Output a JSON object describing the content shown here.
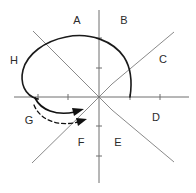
{
  "figure": {
    "background_color": "#ffffff",
    "width": 196,
    "height": 193
  },
  "colors": {
    "axis": "#6e6e6e",
    "diagonal": "#8a8a8a",
    "curve": "#1a1a1a",
    "arrow": "#111111",
    "label_text": "#2b2b2b"
  },
  "axes": {
    "origin": {
      "x": 99,
      "y": 97
    },
    "x_axis": {
      "x1": 14,
      "y1": 97,
      "x2": 189,
      "y2": 97
    },
    "y_axis": {
      "x1": 99,
      "y1": 10,
      "x2": 99,
      "y2": 183
    },
    "x_ticks": [
      38,
      68,
      130,
      160
    ],
    "y_ticks": [
      38,
      68,
      126,
      156
    ],
    "tick_length": 6
  },
  "diagonals": [
    {
      "name": "diagonal-up-right",
      "x1": 112,
      "y1": 84,
      "x2": 174,
      "y2": 32
    },
    {
      "name": "diagonal-down-right",
      "x1": 112,
      "y1": 110,
      "x2": 174,
      "y2": 162
    },
    {
      "name": "diagonal-down-left",
      "x1": 86,
      "y1": 110,
      "x2": 32,
      "y2": 163
    },
    {
      "name": "diagonal-up-left",
      "x1": 86,
      "y1": 84,
      "x2": 33,
      "y2": 31
    }
  ],
  "region_labels": [
    {
      "id": "A",
      "text": "A",
      "x": 77,
      "y": 21
    },
    {
      "id": "B",
      "text": "B",
      "x": 124,
      "y": 21
    },
    {
      "id": "C",
      "text": "C",
      "x": 163,
      "y": 60
    },
    {
      "id": "D",
      "text": "D",
      "x": 156,
      "y": 118
    },
    {
      "id": "E",
      "text": "E",
      "x": 118,
      "y": 143
    },
    {
      "id": "F",
      "text": "F",
      "x": 81,
      "y": 143
    },
    {
      "id": "G",
      "text": "G",
      "x": 29,
      "y": 121
    },
    {
      "id": "H",
      "text": "H",
      "x": 14,
      "y": 61
    }
  ],
  "curve": {
    "name": "loop-trajectory",
    "description": "Closed loop starting on the negative x-axis, sweeping counter-clockwise over the top and terminating on the positive x-axis",
    "start_point": {
      "x": 38,
      "y": 99
    },
    "end_point": {
      "x": 130,
      "y": 97
    },
    "path": "M 38 99 C 24 96 20 82 23 70 C 27 54 45 41 66 37 C 90 32 113 41 124 57 C 131 68 132 84 130 97"
  },
  "arrows": [
    {
      "name": "solid-rotation-arrow",
      "style": "solid",
      "path": "M 35 98 C 41 110 56 116 75 112",
      "head": {
        "x": 80,
        "y": 110,
        "angle": -22
      }
    },
    {
      "name": "dashed-rotation-arrow",
      "style": "dashed",
      "path": "M 34 105 C 40 120 58 127 78 122",
      "head": {
        "x": 83,
        "y": 120,
        "angle": -20
      }
    }
  ]
}
